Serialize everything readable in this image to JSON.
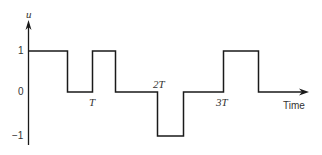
{
  "diagram": {
    "type": "waveform",
    "axis": {
      "y_label": "u",
      "x_label": "Time",
      "y_ticks": [
        "1",
        "0",
        "−1"
      ],
      "x_marks": [
        "T",
        "2T",
        "3T"
      ]
    },
    "levels": {
      "high": 1,
      "zero": 0,
      "low": -1
    },
    "segments": [
      {
        "from": "0",
        "to": "~0.65T",
        "value": 1
      },
      {
        "from": "~0.65T",
        "to": "T",
        "value": 0
      },
      {
        "from": "T",
        "to": "~1.35T",
        "value": 1
      },
      {
        "from": "~1.35T",
        "to": "2T",
        "value": 0
      },
      {
        "from": "2T",
        "to": "~2.4T",
        "value": -1
      },
      {
        "from": "~2.4T",
        "to": "3T",
        "value": 0
      },
      {
        "from": "3T",
        "to": "~3.5T",
        "value": 1
      },
      {
        "from": "~3.5T",
        "to": "end",
        "value": 0
      }
    ],
    "line_color": "#1a1a1a"
  }
}
